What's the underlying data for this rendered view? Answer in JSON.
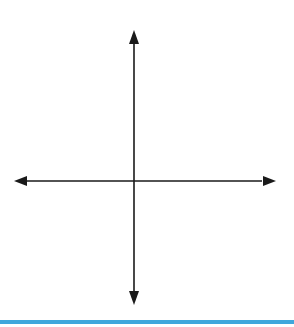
{
  "diagram": {
    "type": "coordinate-grid-transformations",
    "axes": {
      "x_label": "x",
      "y_label": "y",
      "origin_label": "O",
      "x_ticks": [
        {
          "value": -2,
          "label": "−2"
        },
        {
          "value": 2,
          "label": "2"
        },
        {
          "value": 4,
          "label": "4"
        }
      ],
      "y_ticks": [
        {
          "value": 4,
          "label": "4"
        },
        {
          "value": 2,
          "label": "2"
        },
        {
          "value": -2,
          "label": "−2"
        }
      ],
      "x_range": [
        -4,
        4.6
      ],
      "y_range": [
        -4,
        5
      ]
    },
    "grid": {
      "color": "#bfe3ea",
      "unit_px": 29.6
    },
    "shapes": [
      {
        "name": "A",
        "label": "A",
        "color": "#1a1a1a",
        "vertices": [
          [
            2,
            4
          ],
          [
            4,
            3
          ],
          [
            4,
            2
          ],
          [
            2,
            1
          ]
        ],
        "label_pos": [
          2.8,
          2.5
        ]
      },
      {
        "name": "B",
        "label": "B",
        "color": "#d9533f",
        "vertices": [
          [
            2,
            -1
          ],
          [
            4,
            -2
          ],
          [
            4,
            -3
          ],
          [
            2,
            -4
          ]
        ],
        "label_pos": [
          2.8,
          -2.5
        ]
      },
      {
        "name": "C",
        "label": "C",
        "color": "#1a1a1a",
        "vertices": [
          [
            -4,
            -2
          ],
          [
            -1,
            -2
          ],
          [
            -2,
            -4
          ],
          [
            -3,
            -4
          ]
        ],
        "label_pos": [
          -2.5,
          -2.9
        ]
      }
    ],
    "bottom_bar_color": "#3fa7dc"
  }
}
